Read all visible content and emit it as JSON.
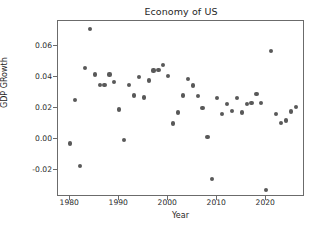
{
  "chart_data": {
    "type": "scatter",
    "title": "Economy of US",
    "xlabel": "Year",
    "ylabel": "GDP GRowth",
    "xlim": [
      1977.5,
      2027.5
    ],
    "ylim": [
      -0.0365,
      0.0765
    ],
    "xticks": [
      1980,
      1990,
      2000,
      2010,
      2020
    ],
    "xtick_labels": [
      "1980",
      "1990",
      "2000",
      "2010",
      "2020"
    ],
    "yticks": [
      -0.02,
      0.0,
      0.02,
      0.04,
      0.06
    ],
    "ytick_labels": [
      "-0.02",
      "0.00",
      "0.02",
      "0.04",
      "0.06"
    ],
    "grid": false,
    "legend": null,
    "marker": {
      "shape": "circle",
      "color": "#595959",
      "size": 4.2
    },
    "x": [
      1980,
      1981,
      1982,
      1984,
      1983,
      1985,
      1986,
      1987,
      1988,
      1989,
      1990,
      1991,
      1992,
      1993,
      1994,
      1995,
      1996,
      1997,
      1998,
      1999,
      2000,
      2001,
      2002,
      2003,
      2004,
      2005,
      2006,
      2007,
      2008,
      2009,
      2010,
      2011,
      2012,
      2013,
      2014,
      2015,
      2016,
      2017,
      2018,
      2019,
      2020,
      2021,
      2022,
      2023,
      2024,
      2025,
      2026
    ],
    "y": [
      -0.003,
      0.025,
      -0.0178,
      0.0715,
      0.046,
      0.0417,
      0.0347,
      0.0348,
      0.0417,
      0.0367,
      0.019,
      -0.0008,
      0.0348,
      0.0281,
      0.0401,
      0.0268,
      0.0378,
      0.0443,
      0.0448,
      0.0479,
      0.0408,
      0.0099,
      0.0171,
      0.0281,
      0.0386,
      0.0346,
      0.0279,
      0.0199,
      0.0011,
      -0.0259,
      0.0263,
      0.0159,
      0.0227,
      0.0181,
      0.0266,
      0.0171,
      0.0227,
      0.0231,
      0.0289,
      0.0232,
      -0.0332,
      0.0568,
      0.0159,
      0.0104,
      0.0119,
      0.0177,
      0.0208
    ],
    "series_note": "GDP growth rate of the United States by year"
  }
}
